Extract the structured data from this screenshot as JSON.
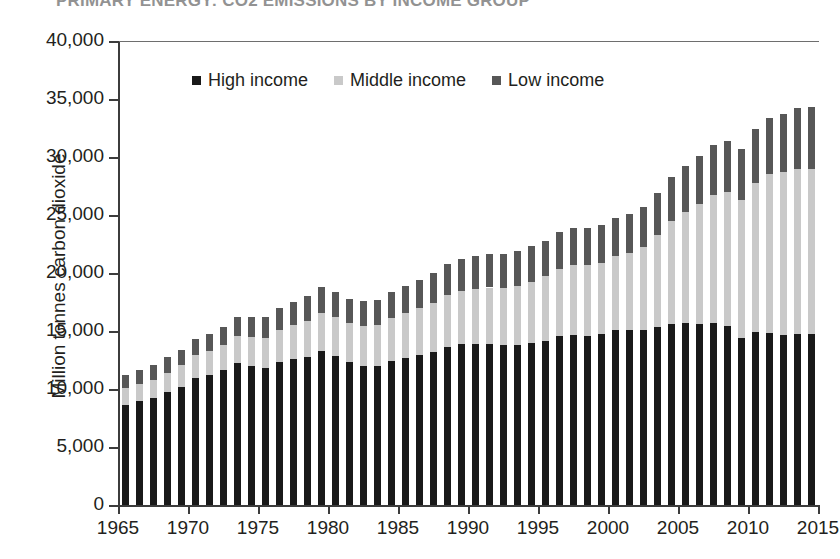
{
  "chart_data": {
    "type": "bar",
    "stacked": true,
    "title": "PRIMARY ENERGY: CO2 EMISSIONS BY INCOME GROUP",
    "xlabel": "",
    "ylabel": "Million tonnes carbon dioxide",
    "ylim": [
      0,
      40000
    ],
    "ytick_labels": [
      "0",
      "5,000",
      "10,000",
      "15,000",
      "20,000",
      "25,000",
      "30,000",
      "35,000",
      "40,000"
    ],
    "ytick_values": [
      0,
      5000,
      10000,
      15000,
      20000,
      25000,
      30000,
      35000,
      40000
    ],
    "xlim": [
      1965,
      2015
    ],
    "xtick_labels": [
      "1965",
      "1970",
      "1975",
      "1980",
      "1985",
      "1990",
      "1995",
      "2000",
      "2005",
      "2010",
      "2015"
    ],
    "xtick_values": [
      1965,
      1970,
      1975,
      1980,
      1985,
      1990,
      1995,
      2000,
      2005,
      2010,
      2015
    ],
    "grid": false,
    "legend_position": "top-center",
    "colors": {
      "high_income": "#191919",
      "middle_income": "#c9c9c9",
      "low_income": "#575757",
      "axis": "#3c3c3c",
      "text": "#231f20"
    },
    "categories": [
      1965,
      1966,
      1967,
      1968,
      1969,
      1970,
      1971,
      1972,
      1973,
      1974,
      1975,
      1976,
      1977,
      1978,
      1979,
      1980,
      1981,
      1982,
      1983,
      1984,
      1985,
      1986,
      1987,
      1988,
      1989,
      1990,
      1991,
      1992,
      1993,
      1994,
      1995,
      1996,
      1997,
      1998,
      1999,
      2000,
      2001,
      2002,
      2003,
      2004,
      2005,
      2006,
      2007,
      2008,
      2009,
      2010,
      2011,
      2012,
      2013,
      2014
    ],
    "series": [
      {
        "name": "High income",
        "color": "#191919",
        "values": [
          8600,
          8950,
          9200,
          9700,
          10200,
          10950,
          11200,
          11600,
          12200,
          12000,
          11800,
          12300,
          12550,
          12800,
          13250,
          12850,
          12300,
          12000,
          12000,
          12400,
          12650,
          12900,
          13200,
          13650,
          13850,
          13900,
          13900,
          13800,
          13800,
          13950,
          14150,
          14550,
          14650,
          14600,
          14700,
          15050,
          15050,
          15100,
          15350,
          15600,
          15700,
          15600,
          15700,
          15450,
          14400,
          14900,
          14800,
          14650,
          14750,
          14750
        ]
      },
      {
        "name": "Middle income",
        "color": "#c9c9c9",
        "values": [
          1450,
          1520,
          1600,
          1720,
          1830,
          1950,
          2060,
          2180,
          2350,
          2450,
          2600,
          2780,
          2930,
          3100,
          3280,
          3320,
          3350,
          3430,
          3550,
          3750,
          3900,
          4080,
          4250,
          4450,
          4600,
          4750,
          4850,
          4900,
          5100,
          5300,
          5550,
          5800,
          6000,
          6050,
          6150,
          6400,
          6700,
          7150,
          7950,
          8850,
          9600,
          10350,
          11050,
          11500,
          11900,
          12900,
          13700,
          14050,
          14250,
          14200
        ]
      },
      {
        "name": "Low income",
        "color": "#575757",
        "values": [
          1150,
          1180,
          1230,
          1300,
          1370,
          1450,
          1520,
          1580,
          1700,
          1750,
          1800,
          1900,
          2000,
          2100,
          2250,
          2200,
          2150,
          2120,
          2150,
          2250,
          2350,
          2450,
          2550,
          2700,
          2800,
          2850,
          2900,
          2950,
          3000,
          3050,
          3100,
          3200,
          3250,
          3200,
          3250,
          3300,
          3350,
          3450,
          3600,
          3800,
          3950,
          4100,
          4250,
          4400,
          4400,
          4650,
          4900,
          5050,
          5250,
          5350
        ]
      }
    ]
  },
  "legend": {
    "items": [
      {
        "label": "High income",
        "swatch_class": "sw-high"
      },
      {
        "label": "Middle income",
        "swatch_class": "sw-middle"
      },
      {
        "label": "Low income",
        "swatch_class": "sw-low"
      }
    ]
  }
}
